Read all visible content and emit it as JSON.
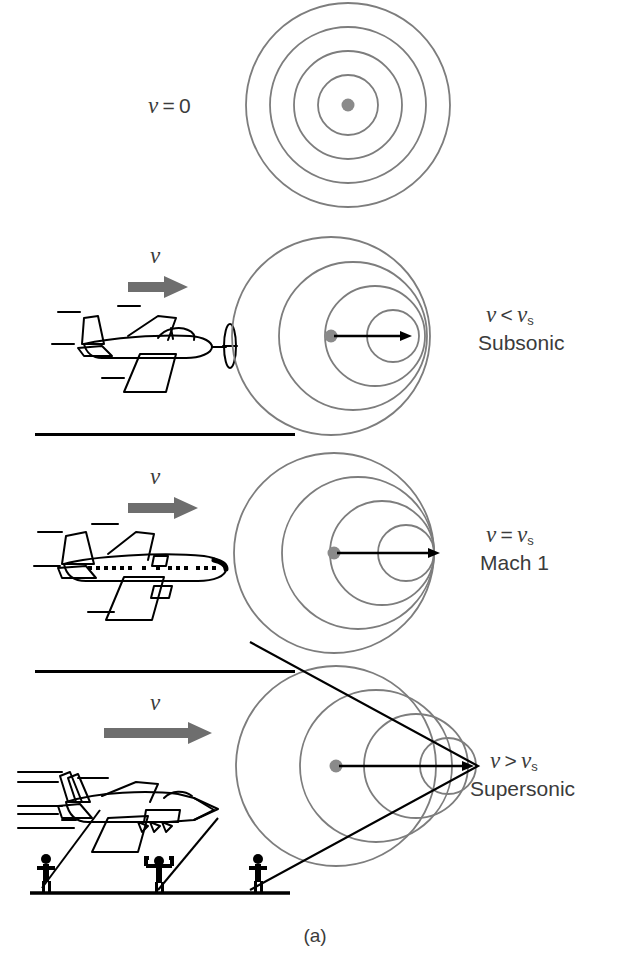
{
  "figure": {
    "caption": "(a)",
    "colors": {
      "wavefront": "#7d7d7d",
      "source_dot": "#8a8a8a",
      "velocity_arrow": "#6e6e6e",
      "aircraft_outline": "#000000",
      "mach_cone": "#000000",
      "text": "#3b3b3b",
      "divider": "#000000",
      "ground": "#000000",
      "observer": "#000000"
    }
  },
  "panels": [
    {
      "id": "stationary",
      "velocity_label": {
        "v": "v",
        "op": "=",
        "rhs": "0"
      },
      "condition_label": null,
      "condition_name": null,
      "has_aircraft": false,
      "has_velocity_arrow": false,
      "wave": {
        "type": "concentric",
        "num_circles": 4,
        "center": {
          "x": 348,
          "y": 105
        },
        "radii": [
          30,
          54,
          78,
          102
        ],
        "offsets": [
          0,
          0,
          0,
          0
        ]
      }
    },
    {
      "id": "subsonic",
      "velocity_label": null,
      "condition_label": {
        "v": "v",
        "op": "<",
        "rhs": "v",
        "rhs_sub": "s"
      },
      "condition_name": "Subsonic",
      "arrow_label": "v",
      "aircraft": "propeller-plane",
      "has_aircraft": true,
      "has_velocity_arrow": true,
      "wave": {
        "type": "doppler",
        "num_circles": 4,
        "source": {
          "x": 331,
          "y": 336
        },
        "radii": [
          99,
          74,
          50,
          26
        ],
        "offsets": [
          0,
          22,
          44,
          62
        ]
      },
      "motion_arrow": {
        "from_x": 331,
        "to_x": 412,
        "y": 336
      }
    },
    {
      "id": "mach1",
      "velocity_label": null,
      "condition_label": {
        "v": "v",
        "op": "=",
        "rhs": "v",
        "rhs_sub": "s"
      },
      "condition_name": "Mach 1",
      "arrow_label": "v",
      "aircraft": "airliner",
      "has_aircraft": true,
      "has_velocity_arrow": true,
      "wave": {
        "type": "mach1",
        "num_circles": 4,
        "source": {
          "x": 334,
          "y": 553
        },
        "radii": [
          100,
          76,
          52,
          28
        ],
        "offsets": [
          0,
          24,
          48,
          72
        ]
      },
      "motion_arrow": {
        "from_x": 334,
        "to_x": 448,
        "y": 553
      }
    },
    {
      "id": "supersonic",
      "velocity_label": null,
      "condition_label": {
        "v": "v",
        "op": ">",
        "rhs": "v",
        "rhs_sub": "s"
      },
      "condition_name": "Supersonic",
      "arrow_label": "v",
      "aircraft": "fighter-jet",
      "has_aircraft": true,
      "has_velocity_arrow": true,
      "has_observers": true,
      "observer_count": 3,
      "has_ground": true,
      "has_mach_cone": true,
      "wave": {
        "type": "supersonic",
        "num_circles": 4,
        "source": {
          "x": 336,
          "y": 766
        },
        "radii": [
          100,
          76,
          52,
          28
        ],
        "offsets": [
          0,
          40,
          80,
          112
        ]
      },
      "motion_arrow": {
        "from_x": 336,
        "to_x": 474,
        "y": 766
      }
    }
  ],
  "dividers": [
    {
      "x": 35,
      "y": 433,
      "width": 260
    },
    {
      "x": 35,
      "y": 670,
      "width": 260
    }
  ]
}
